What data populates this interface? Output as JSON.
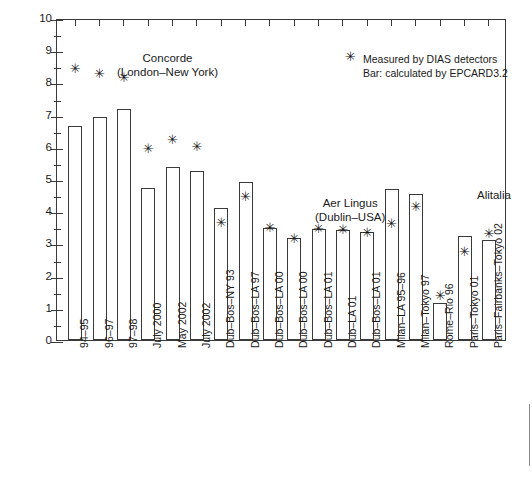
{
  "chart_data": {
    "type": "bar",
    "title": "",
    "xlabel": "",
    "ylabel": "Dose equivalent (μSv/h)",
    "ylim": [
      0,
      10
    ],
    "ytick_step": 1,
    "yminor_step": 0.5,
    "grid": false,
    "legend_position": "top-right",
    "categories": [
      "94–95",
      "96–97",
      "97–98",
      "July 2000",
      "May 2002",
      "July 2002",
      "Dub–Bos–NY 93",
      "Dub–Bos–LA 97",
      "Dub–Bos–LA 00",
      "Dub–Bos–LA 00",
      "Dub–Bos–LA 01",
      "Dub–LA 01",
      "Dub–Bos–LA 01",
      "Milan–LA 95–96",
      "Milan–Tokyo 97",
      "Rome–Rio 96",
      "Paris–Tokyo 01",
      "Paris–Fairbanks–Tokyo 02"
    ],
    "series": [
      {
        "name": "Bar: calculated by EPCARD3.2",
        "values": [
          6.65,
          6.92,
          7.17,
          4.73,
          5.38,
          5.25,
          4.1,
          4.92,
          3.48,
          3.17,
          3.45,
          3.42,
          3.35,
          4.7,
          4.55,
          1.15,
          3.22,
          3.12
        ]
      },
      {
        "name": "Measured by DIAS detectors",
        "marker": "✳",
        "values": [
          8.5,
          8.35,
          8.22,
          6.02,
          6.3,
          6.07,
          3.7,
          4.52,
          3.57,
          3.22,
          3.52,
          3.48,
          3.4,
          3.68,
          4.22,
          1.45,
          2.8,
          3.38
        ]
      }
    ]
  },
  "legend": {
    "symbol": "✳",
    "items": [
      "Measured by DIAS detectors",
      "Bar: calculated by EPCARD3.2"
    ]
  },
  "annotations": [
    {
      "text": "Concorde\n(London–New York)",
      "left": 60,
      "top": 31
    },
    {
      "text": "Aer Lingus\n(Dublin–USA)",
      "left": 258,
      "top": 176
    },
    {
      "text": "Alitalia",
      "left": 420,
      "top": 168
    },
    {
      "text": "Air\nFrance",
      "left": 478,
      "top": 198
    }
  ],
  "y_ticks": [
    "0",
    "1",
    "2",
    "3",
    "4",
    "5",
    "6",
    "7",
    "8",
    "9",
    "10"
  ]
}
